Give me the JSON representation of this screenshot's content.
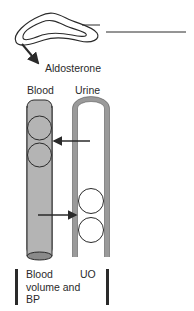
{
  "diagram": {
    "hormone_label": "Aldosterone",
    "columns": {
      "blood": "Blood",
      "urine": "Urine"
    },
    "outcomes": {
      "blood": "Blood volume and BP",
      "urine": "UO"
    },
    "colors": {
      "stroke": "#2a2a2a",
      "blood_fill": "#b4b4b4",
      "circle_fill_blood": "#b4b4b4",
      "tube_wall": "#9a9a9a",
      "background": "#ffffff"
    },
    "arrows": [
      {
        "from": "urine",
        "to": "blood",
        "meaning": "reabsorption"
      },
      {
        "from": "blood",
        "to": "urine",
        "meaning": "secretion"
      }
    ],
    "icons": {
      "gland": "adrenal-gland-icon",
      "blood_vessel": "blood-vessel-icon",
      "tubule": "renal-tubule-icon",
      "particle": "circle-particle-icon"
    }
  }
}
